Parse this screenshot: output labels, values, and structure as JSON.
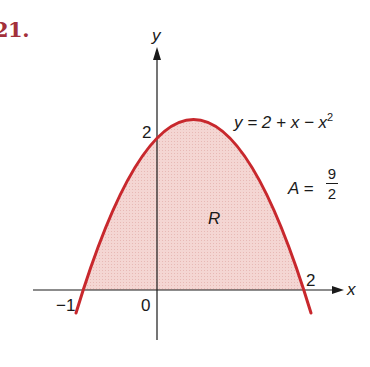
{
  "problem": {
    "number": "21."
  },
  "axes": {
    "x_label": "x",
    "y_label": "y",
    "origin_label": "0",
    "x_ticks": [
      {
        "value": -1,
        "label": "−1"
      },
      {
        "value": 2,
        "label": "2"
      }
    ],
    "y_ticks": [
      {
        "value": 2,
        "label": "2"
      }
    ]
  },
  "curve": {
    "equation_prefix": "y = 2 + x − x",
    "equation_exponent": "2",
    "color": "#c8282d"
  },
  "region": {
    "label": "R",
    "fill_color": "#f2cfcc",
    "area_prefix": "A =",
    "area_numerator": "9",
    "area_denominator": "2"
  },
  "colors": {
    "problem_number": "#a3303a",
    "curve": "#c8282d",
    "region_fill": "#f2cfcc",
    "axes": "#1a1a1a"
  }
}
